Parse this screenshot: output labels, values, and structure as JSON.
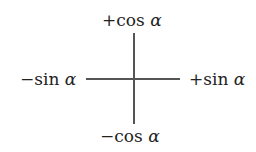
{
  "diagram": {
    "labels": {
      "top": {
        "sign": "+",
        "fn": "cos",
        "var": "α"
      },
      "bottom": {
        "sign": "−",
        "fn": "cos",
        "var": "α"
      },
      "left": {
        "sign": "−",
        "fn": "sin",
        "var": "α"
      },
      "right": {
        "sign": "+",
        "fn": "sin",
        "var": "α"
      }
    },
    "line_color": "#555555"
  }
}
